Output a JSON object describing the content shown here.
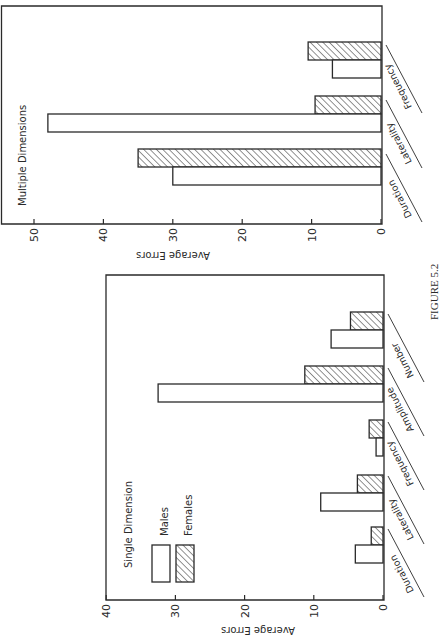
{
  "figure": {
    "caption": "FIGURE 5.2",
    "orientation": "page rotated 90 degrees; bars extend right-to-left from baseline at right"
  },
  "legend": {
    "title": "Single Dimension",
    "items": [
      {
        "label": "Males",
        "pattern": "open"
      },
      {
        "label": "Females",
        "pattern": "hatched"
      }
    ]
  },
  "colors": {
    "ink": "#2a2a2a",
    "paper": "#ffffff",
    "hatch": "#3a3a3a"
  },
  "chart_data": [
    {
      "type": "bar",
      "title": "Multiple Dimensions",
      "xlabel": "",
      "ylabel": "Average Errors",
      "ylim": [
        0,
        50
      ],
      "yticks": [
        0,
        10,
        20,
        30,
        40,
        50
      ],
      "grid": false,
      "categories": [
        "Duration",
        "Laterality",
        "Frequency"
      ],
      "series": [
        {
          "name": "Males",
          "pattern": "open",
          "values": [
            30,
            48,
            7
          ]
        },
        {
          "name": "Females",
          "pattern": "hatched",
          "values": [
            35,
            9.5,
            10.5
          ]
        }
      ]
    },
    {
      "type": "bar",
      "title": "Single Dimension",
      "xlabel": "",
      "ylabel": "Average Errors",
      "ylim": [
        0,
        40
      ],
      "yticks": [
        0,
        10,
        20,
        30,
        40
      ],
      "grid": false,
      "legend_position": "upper-left",
      "categories": [
        "Duration",
        "Laterality",
        "Frequency",
        "Amplitude",
        "Number"
      ],
      "series": [
        {
          "name": "Males",
          "pattern": "open",
          "values": [
            4,
            9,
            1,
            32.5,
            7.5
          ]
        },
        {
          "name": "Females",
          "pattern": "hatched",
          "values": [
            1.7,
            3.7,
            2,
            11.3,
            4.7
          ]
        }
      ]
    }
  ]
}
